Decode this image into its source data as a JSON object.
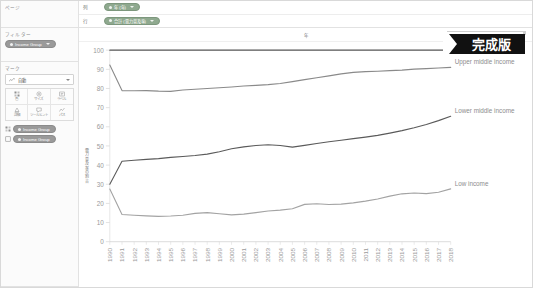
{
  "window": {
    "badge_label": "完成版"
  },
  "shelf_panel": {
    "pages_title": "ページ",
    "filters_title": "フィルター",
    "filter_pill": "Income Group",
    "columns_label": "列",
    "rows_label": "行",
    "columns_pill": "年 (年)",
    "rows_pill": "合計 (電力普及率)"
  },
  "marks": {
    "title": "マーク",
    "type_label": "自動",
    "buttons": [
      {
        "name": "color",
        "label": "色",
        "icon": "palette-icon"
      },
      {
        "name": "size",
        "label": "サイズ",
        "icon": "size-icon"
      },
      {
        "name": "label",
        "label": "ラベル",
        "icon": "label-icon"
      },
      {
        "name": "detail",
        "label": "詳細",
        "icon": "detail-icon"
      },
      {
        "name": "tooltip",
        "label": "ツールヒント",
        "icon": "tooltip-icon"
      },
      {
        "name": "path",
        "label": "パス",
        "icon": "path-icon"
      }
    ],
    "pills": [
      {
        "slot": "color",
        "label": "Income Group",
        "icon": "color-slot-icon"
      },
      {
        "slot": "detail",
        "label": "Income Group",
        "icon": "detail-slot-icon"
      }
    ]
  },
  "chart_data": {
    "type": "line",
    "title": "年",
    "xlabel": "年",
    "ylabel": "電力普及率の割合",
    "ylim": [
      0,
      100
    ],
    "yticks": [
      0,
      10,
      20,
      30,
      40,
      50,
      60,
      70,
      80,
      90,
      100
    ],
    "grid": false,
    "legend_position": "inline-right",
    "categories": [
      1990,
      1991,
      1992,
      1993,
      1994,
      1995,
      1996,
      1997,
      1998,
      1999,
      2000,
      2001,
      2002,
      2003,
      2004,
      2005,
      2006,
      2007,
      2008,
      2009,
      2010,
      2011,
      2012,
      2013,
      2014,
      2015,
      2016,
      2017,
      2018
    ],
    "series": [
      {
        "name": "High income",
        "color": "#555555",
        "values": [
          100,
          100,
          100,
          100,
          100,
          100,
          100,
          100,
          100,
          100,
          100,
          100,
          100,
          100,
          100,
          100,
          100,
          100,
          100,
          100,
          100,
          100,
          100,
          100,
          100,
          100,
          100,
          100,
          100
        ]
      },
      {
        "name": "Upper middle income",
        "color": "#8a8a8a",
        "values": [
          92.2,
          78.9,
          78.8,
          78.9,
          78.6,
          78.5,
          79.2,
          79.6,
          80.0,
          80.4,
          80.8,
          81.3,
          81.6,
          82.0,
          82.6,
          83.6,
          84.6,
          85.6,
          86.6,
          87.6,
          88.4,
          88.8,
          89.0,
          89.3,
          89.6,
          90.1,
          90.4,
          90.7,
          91.0
        ]
      },
      {
        "name": "Lower middle income",
        "color": "#5a5a5a",
        "values": [
          30.0,
          42.0,
          42.5,
          43.0,
          43.4,
          44.0,
          44.5,
          45.0,
          45.7,
          47.0,
          48.5,
          49.5,
          50.2,
          50.6,
          50.2,
          49.4,
          50.3,
          51.3,
          52.2,
          53.0,
          53.8,
          54.6,
          55.5,
          56.7,
          58.0,
          59.5,
          61.2,
          63.2,
          65.5
        ]
      },
      {
        "name": "Low income",
        "color": "#a3a3a3",
        "values": [
          27.5,
          14.2,
          13.8,
          13.5,
          13.2,
          13.4,
          13.8,
          14.8,
          15.2,
          14.6,
          14.0,
          14.4,
          15.2,
          16.0,
          16.5,
          17.2,
          19.5,
          19.8,
          19.4,
          19.6,
          20.3,
          21.2,
          22.3,
          23.8,
          25.0,
          25.4,
          25.1,
          25.8,
          27.6
        ]
      }
    ]
  }
}
